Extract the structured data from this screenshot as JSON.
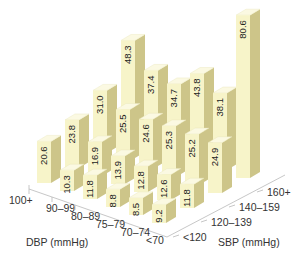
{
  "chart_data": {
    "type": "bar3d",
    "title": "",
    "x_axis": {
      "label": "DBP (mmHg)",
      "categories": [
        "100+",
        "90–99",
        "80–89",
        "75–79",
        "70–74",
        "<70"
      ]
    },
    "y_axis": {
      "label": "SBP (mmHg)",
      "categories": [
        "<120",
        "120–139",
        "140–159",
        "160+"
      ]
    },
    "series": [
      {
        "name": "<120",
        "values": [
          20.6,
          10.3,
          11.8,
          8.8,
          8.5,
          9.2
        ]
      },
      {
        "name": "120–139",
        "values": [
          23.8,
          16.9,
          13.9,
          12.8,
          12.6,
          11.8
        ]
      },
      {
        "name": "140–159",
        "values": [
          31.0,
          25.5,
          24.6,
          25.3,
          25.2,
          24.9
        ]
      },
      {
        "name": "160+",
        "values": [
          48.3,
          37.4,
          34.7,
          43.8,
          38.1,
          80.6
        ]
      }
    ],
    "value_labels": [
      [
        "20.6",
        "10.3",
        "11.8",
        "8.8",
        "8.5",
        "9.2"
      ],
      [
        "23.8",
        "16.9",
        "13.9",
        "12.8",
        "12.6",
        "11.8"
      ],
      [
        "31.0",
        "25.5",
        "24.6",
        "25.3",
        "25.2",
        "24.9"
      ],
      [
        "48.3",
        "37.4",
        "34.7",
        "43.8",
        "38.1",
        "80.6"
      ]
    ],
    "grid": false,
    "legend": false,
    "colors": {
      "front": "#f7f4c9",
      "side": "#cdc589",
      "top": "#fbf9e2",
      "floor_line": "#b9b9b9",
      "text": "#222222"
    }
  }
}
